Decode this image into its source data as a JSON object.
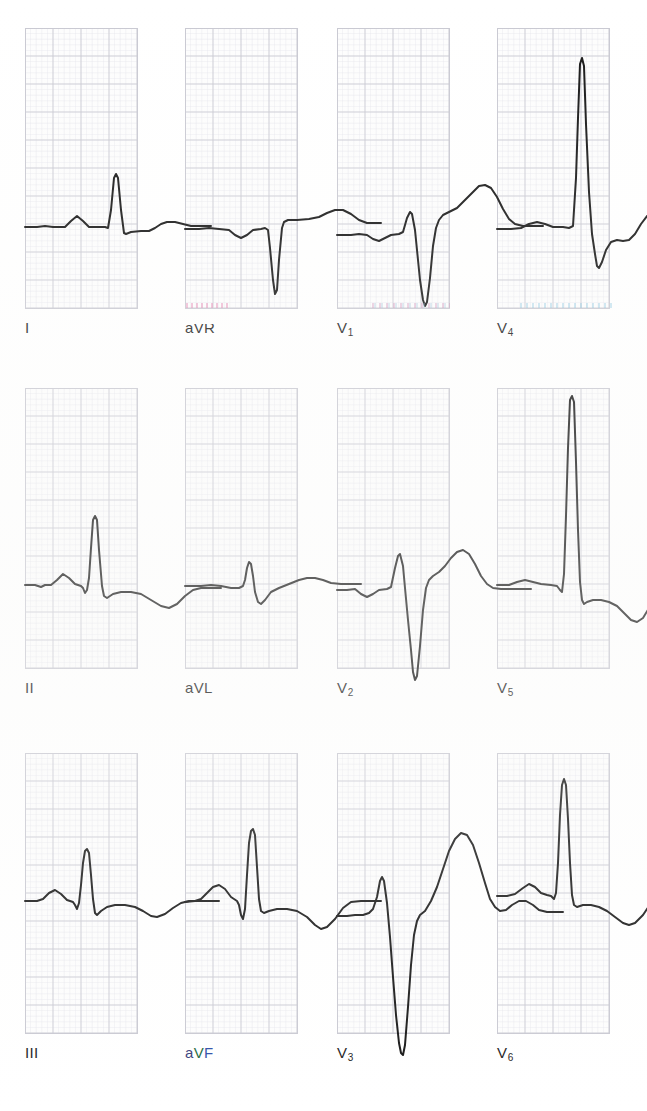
{
  "document": {
    "kind": "12-lead electrocardiogram",
    "background_color": "#ffffff",
    "trace_color": "#161616",
    "grid_major_color": "#c9c9d2",
    "grid_minor_color": "#e6e6ec",
    "label_color": "#1c1c1c"
  },
  "grid": {
    "minor_spacing_px": 5.6,
    "major_spacing_px": 28,
    "panel_width_px": 113,
    "panel_height_px": 281
  },
  "layout": {
    "columns": 4,
    "rows": 3,
    "column_x": [
      25,
      185,
      337,
      497
    ],
    "row_y": [
      28,
      388,
      753
    ],
    "label_offset_y": 292
  },
  "leads": [
    {
      "id": "I",
      "label": "I",
      "subscript": "",
      "row": 0,
      "col": 0,
      "baseline_y": 199,
      "amplitudes": {
        "p_mm": 3,
        "r_mm": 54,
        "s_mm": 7,
        "t_mm": 3
      },
      "morphology": "small upright P, tall narrow R, small S, small flat T",
      "path": "M0,199 L12,199 L20,198 L28,199 L40,199 L46,193 L52,188 L58,193 L64,199 L80,199 L83,200 L86,182 L89,150 L91,146 L93,150 L96,182 L99,205 L101,206 L106,204 L116,203 L124,203 L130,200 L136,196 L142,194 L150,194 L158,196 L166,198 L176,198 L186,198"
    },
    {
      "id": "aVR",
      "label": "aVR",
      "subscript": "",
      "row": 0,
      "col": 1,
      "baseline_y": 199,
      "amplitudes": {
        "p_mm": -3,
        "q_mm": 0,
        "s_mm": -66,
        "t_mm": 7
      },
      "morphology": "inverted P, deep QS complex, small upright T",
      "path": "M0,201 L14,201 L24,200 L34,201 L44,202 L50,207 L56,210 L62,207 L68,202 L76,201 L80,200 L83,202 L85,220 L88,252 L90,266 L92,262 L94,232 L97,200 L99,194 L103,192 L112,192 L124,191 L134,189 L142,185 L150,182 L158,182 L166,186 L174,192 L182,195 L190,195 L196,195"
    },
    {
      "id": "V1",
      "label": "V",
      "subscript": "1",
      "row": 0,
      "col": 2,
      "baseline_y": 207,
      "amplitudes": {
        "p_mm": -3,
        "r_mm": 22,
        "s_mm": -71,
        "t_mm": 23
      },
      "morphology": "small R, deep S, broad upright T",
      "path": "M0,207 L14,207 L22,206 L30,207 L36,211 L42,213 L48,210 L54,207 L62,206 L66,204 L70,190 L73,184 L75,186 L78,202 L80,222 L83,252 L86,272 L88,278 L90,274 L93,250 L96,218 L99,200 L102,192 L106,187 L112,184 L120,180 L128,172 L136,164 L142,158 L148,157 L154,160 L160,169 L166,181 L172,191 L178,196 L186,198 L196,198 L206,198"
    },
    {
      "id": "V4",
      "label": "V",
      "subscript": "4",
      "row": 0,
      "col": 3,
      "baseline_y": 199,
      "amplitudes": {
        "p_mm": 4,
        "r_mm": 186,
        "s_mm": -41,
        "t_mm": 12
      },
      "morphology": "very tall R wave, deep S, modest upright T with U wave",
      "path": "M0,201 L14,201 L24,200 L32,196 L40,194 L48,196 L56,199 L66,199 L72,200 L76,198 L79,150 L81,90 L83,36 L85,30 L87,38 L89,96 L92,164 L95,206 L98,226 L100,238 L102,240 L105,234 L109,222 L114,214 L120,212 L126,213 L132,212 L138,206 L144,196 L150,188 L156,186 L162,190 L168,198 L174,202 L180,200 L186,196 L194,194 L202,194 L210,194"
    },
    {
      "id": "II",
      "label": "II",
      "subscript": "",
      "row": 1,
      "col": 0,
      "baseline_y": 197,
      "amplitudes": {
        "p_mm": 8,
        "r_mm": 70,
        "s_mm": -10,
        "t_mm": -10
      },
      "morphology": "upright P, tall R, small S, inverted T",
      "path": "M0,197 L10,197 L16,199 L20,197 L26,197 L32,192 L38,186 L44,190 L50,196 L56,198 L58,200 L60,205 L62,202 L64,190 L66,160 L68,132 L70,128 L72,132 L74,162 L77,198 L79,208 L82,210 L88,206 L96,204 L106,204 L116,206 L126,212 L136,218 L144,220 L152,216 L160,208 L168,202 L176,200 L186,200 L196,200"
    },
    {
      "id": "aVL",
      "label": "aVL",
      "subscript": "",
      "row": 1,
      "col": 1,
      "baseline_y": 198,
      "amplitudes": {
        "p_mm": 2,
        "r_mm": 26,
        "s_mm": -16,
        "t_mm": 5
      },
      "morphology": "small R, small S, low upright T",
      "path": "M0,198 L16,198 L26,197 L36,198 L46,200 L54,200 L58,198 L60,192 L62,180 L64,174 L66,176 L68,188 L70,204 L73,214 L76,216 L80,212 L86,204 L94,200 L104,196 L114,192 L122,190 L130,190 L138,192 L146,195 L156,196 L166,196 L176,196"
    },
    {
      "id": "V2",
      "label": "V",
      "subscript": "2",
      "row": 1,
      "col": 2,
      "baseline_y": 202,
      "amplitudes": {
        "p_mm": -4,
        "r_mm": 38,
        "s_mm": -92,
        "t_mm": 34
      },
      "morphology": "small R, very deep S, large broad upright T",
      "path": "M0,202 L10,202 L18,201 L24,206 L30,209 L36,206 L42,202 L50,201 L54,199 L58,180 L61,168 L63,166 L66,178 L68,200 L71,232 L74,262 L76,284 L78,292 L80,288 L83,258 L86,222 L89,200 L92,192 L96,188 L102,184 L108,178 L114,170 L120,164 L126,162 L132,166 L138,176 L144,188 L150,196 L156,200 L164,201 L174,201 L184,201 L194,201"
    },
    {
      "id": "V5",
      "label": "V",
      "subscript": "5",
      "row": 1,
      "col": 3,
      "baseline_y": 196,
      "amplitudes": {
        "p_mm": 3,
        "r_mm": 188,
        "s_mm": -12,
        "t_mm": -20
      },
      "morphology": "very tall R exceeding panel top, inverted T",
      "path": "M0,197 L12,197 L20,194 L28,192 L36,194 L44,196 L54,197 L60,198 L63,202 L65,204 L67,186 L69,128 L71,60 L73,12 L75,8 L77,14 L79,74 L81,142 L83,194 L85,212 L87,216 L90,214 L96,212 L104,212 L112,214 L120,218 L128,226 L134,232 L140,234 L146,230 L152,220 L158,208 L164,200 L172,196 L182,196 L192,196 L202,196"
    },
    {
      "id": "III",
      "label": "III",
      "subscript": "",
      "row": 2,
      "col": 0,
      "baseline_y": 148,
      "amplitudes": {
        "p_mm": 6,
        "r_mm": 52,
        "s_mm": -14,
        "t_mm": -8
      },
      "morphology": "upright P, tall R, S wave, shallow inverted T",
      "path": "M0,148 L12,148 L18,146 L24,140 L30,137 L36,141 L42,147 L48,149 L50,152 L52,156 L54,150 L56,132 L58,110 L60,98 L62,96 L64,100 L66,122 L68,146 L70,160 L72,162 L76,158 L82,154 L90,152 L100,152 L110,154 L118,158 L126,163 L132,164 L140,161 L148,155 L156,150 L164,148 L174,148 L184,148 L194,148"
    },
    {
      "id": "aVF",
      "label": "aVF",
      "subscript": "",
      "row": 2,
      "col": 1,
      "baseline_y": 148,
      "amplitudes": {
        "p_mm": 7,
        "r_mm": 62,
        "s_mm": -18,
        "t_mm": -12
      },
      "morphology": "upright P, tall R, S wave, inverted T",
      "path": "M0,149 L10,148 L16,146 L22,140 L28,134 L34,132 L40,136 L46,144 L52,148 L54,152 L56,162 L58,166 L60,156 L62,122 L64,90 L66,78 L68,76 L70,82 L72,114 L74,146 L76,158 L79,160 L84,158 L92,156 L102,156 L112,158 L122,164 L130,172 L136,176 L142,174 L150,166 L158,155 L166,149 L176,148 L186,148 L196,148"
    },
    {
      "id": "V3",
      "label": "V",
      "subscript": "3",
      "row": 2,
      "col": 2,
      "baseline_y": 162,
      "amplitudes": {
        "p_mm": 2,
        "r_mm": 42,
        "s_mm": -150,
        "t_mm": 52,
        "u_mm": 10
      },
      "morphology": "small R, extremely deep S, very large broad T with U wave",
      "path": "M0,163 L10,163 L18,162 L26,162 L32,160 L36,156 L40,144 L43,128 L45,124 L47,128 L50,150 L53,184 L56,224 L59,262 L62,290 L64,300 L66,302 L68,292 L71,254 L74,212 L77,182 L80,168 L83,162 L88,158 L94,148 L100,134 L106,116 L112,98 L118,86 L124,80 L130,82 L136,92 L142,110 L148,130 L153,146 L158,154 L163,158 L169,157 L175,152 L182,148 L189,148 L196,152 L202,157 L210,159 L218,159 L226,159"
    },
    {
      "id": "V6",
      "label": "V",
      "subscript": "6",
      "row": 2,
      "col": 3,
      "baseline_y": 142,
      "amplitudes": {
        "p_mm": 6,
        "r_mm": 110,
        "s_mm": -10,
        "t_mm": -14
      },
      "morphology": "upright P, tall R, shallow inverted T",
      "path": "M0,143 L10,143 L18,141 L26,135 L32,131 L38,134 L44,140 L50,142 L54,143 L57,146 L59,140 L61,110 L63,62 L65,32 L67,26 L69,32 L71,66 L73,110 L75,142 L77,152 L80,154 L86,152 L94,152 L102,154 L110,158 L118,164 L126,170 L132,172 L138,170 L146,162 L154,150 L162,142 L170,139 L180,139 L190,139 L200,139"
    }
  ],
  "artifacts": [
    {
      "name": "scan-fringe-avr",
      "style": "fringe-pink",
      "x": 186,
      "y": 303,
      "width": 42
    },
    {
      "name": "scan-fringe-v1",
      "style": "fringe-mixed",
      "x": 372,
      "y": 303,
      "width": 78
    },
    {
      "name": "scan-fringe-v4",
      "style": "fringe-cyan",
      "x": 520,
      "y": 303,
      "width": 96
    }
  ]
}
